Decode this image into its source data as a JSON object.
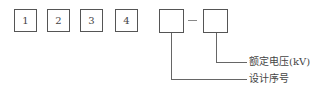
{
  "diagram": {
    "boxes": [
      {
        "id": "box-1",
        "label": "1"
      },
      {
        "id": "box-2",
        "label": "2"
      },
      {
        "id": "box-3",
        "label": "3"
      },
      {
        "id": "box-4",
        "label": "4"
      },
      {
        "id": "box-5",
        "label": ""
      },
      {
        "id": "box-6",
        "label": ""
      }
    ],
    "separator": "–",
    "callouts": {
      "rated_voltage": "额定电压(kV)",
      "design_serial": "设计序号"
    }
  }
}
